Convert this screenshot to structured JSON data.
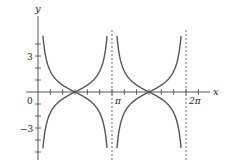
{
  "chart_data": {
    "type": "line",
    "title": "",
    "xlabel": "x",
    "ylabel": "y",
    "functions": [
      "y = |cot x|",
      "y = -|cot x|"
    ],
    "xlim": [
      -0.3,
      2.25
    ],
    "xlim_units": "multiples of pi",
    "ylim": [
      -5.5,
      6.5
    ],
    "x_tick_step": "pi/6",
    "y_tick_step": 1,
    "x_tick_labels": [
      {
        "value": 0,
        "label": "0"
      },
      {
        "value": 3.14159,
        "label": "π"
      },
      {
        "value": 6.28319,
        "label": "2π"
      }
    ],
    "y_tick_labels": [
      {
        "value": 3,
        "label": "3"
      },
      {
        "value": -3,
        "label": "−3"
      }
    ],
    "asymptotes": [
      {
        "x": 3.14159,
        "label": "π",
        "style": "dashed"
      },
      {
        "x": 6.28319,
        "label": "2π",
        "style": "dashed"
      }
    ],
    "series": [
      {
        "name": "upper",
        "formula": "|cot x|",
        "x_range": [
          0.2,
          6.1
        ],
        "zeros": [
          1.5708,
          4.7124
        ]
      },
      {
        "name": "lower",
        "formula": "-|cot x|",
        "x_range": [
          0.2,
          6.1
        ],
        "zeros": [
          1.5708,
          4.7124
        ]
      }
    ],
    "grid": false,
    "legend": "none",
    "line_color": "#555555"
  },
  "labels": {
    "x_axis": "x",
    "y_axis": "y",
    "y3": "3",
    "ym3": "−3",
    "zero": "0",
    "pi": "π",
    "two_pi": "2π"
  }
}
